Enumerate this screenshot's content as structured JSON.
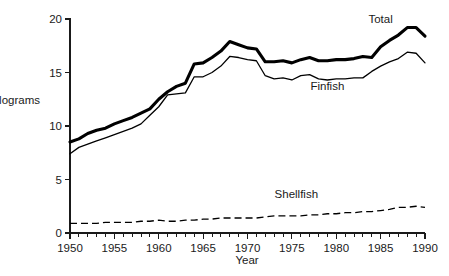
{
  "chart_data": {
    "type": "line",
    "title": "",
    "xlabel": "Year",
    "ylabel": "Kilograms",
    "xlim": [
      1950,
      1990
    ],
    "ylim": [
      0,
      20
    ],
    "grid": false,
    "legend_position": "inline-annotations",
    "yticks": [
      0,
      5,
      10,
      15,
      20
    ],
    "ytick_labels": [
      "0",
      "5",
      "10",
      "15",
      "20"
    ],
    "xticks": [
      1950,
      1955,
      1960,
      1965,
      1970,
      1975,
      1980,
      1985,
      1990
    ],
    "xtick_labels": [
      "1950",
      "1955",
      "1960",
      "1965",
      "1970",
      "1975",
      "1980",
      "1985",
      "1990"
    ],
    "x_minor_tick_interval": 1,
    "x": [
      1950,
      1951,
      1952,
      1953,
      1954,
      1955,
      1956,
      1957,
      1958,
      1959,
      1960,
      1961,
      1962,
      1963,
      1964,
      1965,
      1966,
      1967,
      1968,
      1969,
      1970,
      1971,
      1972,
      1973,
      1974,
      1975,
      1976,
      1977,
      1978,
      1979,
      1980,
      1981,
      1982,
      1983,
      1984,
      1985,
      1986,
      1987,
      1988,
      1989,
      1990
    ],
    "series": [
      {
        "name": "Total",
        "style": "thick-solid",
        "color": "#000000",
        "values": [
          8.5,
          8.8,
          9.3,
          9.6,
          9.8,
          10.2,
          10.5,
          10.8,
          11.2,
          11.6,
          12.5,
          13.2,
          13.7,
          14.0,
          15.8,
          15.9,
          16.4,
          17.0,
          17.9,
          17.6,
          17.3,
          17.2,
          16.0,
          16.0,
          16.1,
          15.9,
          16.2,
          16.4,
          16.1,
          16.1,
          16.2,
          16.2,
          16.3,
          16.5,
          16.4,
          17.4,
          18.0,
          18.5,
          19.2,
          19.2,
          18.4
        ]
      },
      {
        "name": "Finfish",
        "style": "thin-solid",
        "color": "#000000",
        "values": [
          7.4,
          8.0,
          8.3,
          8.6,
          8.9,
          9.2,
          9.5,
          9.8,
          10.2,
          11.0,
          11.8,
          12.9,
          13.0,
          13.1,
          14.6,
          14.6,
          15.0,
          15.6,
          16.5,
          16.4,
          16.2,
          16.1,
          14.7,
          14.4,
          14.5,
          14.3,
          14.7,
          14.8,
          14.4,
          14.3,
          14.4,
          14.4,
          14.5,
          14.5,
          15.1,
          15.6,
          16.0,
          16.3,
          16.9,
          16.8,
          15.9
        ]
      },
      {
        "name": "Shellfish",
        "style": "dashed",
        "color": "#000000",
        "values": [
          0.9,
          0.9,
          0.9,
          0.9,
          1.0,
          1.0,
          1.0,
          1.0,
          1.1,
          1.1,
          1.2,
          1.1,
          1.1,
          1.2,
          1.2,
          1.3,
          1.3,
          1.4,
          1.4,
          1.4,
          1.4,
          1.4,
          1.5,
          1.6,
          1.6,
          1.6,
          1.6,
          1.7,
          1.7,
          1.8,
          1.8,
          1.9,
          1.9,
          2.0,
          2.0,
          2.1,
          2.2,
          2.4,
          2.4,
          2.5,
          2.4
        ]
      }
    ],
    "annotations": [
      {
        "text": "Total",
        "x": 1985.0,
        "y": 19.6
      },
      {
        "text": "Finfish",
        "x": 1979.0,
        "y": 13.4
      },
      {
        "text": "Shellfish",
        "x": 1975.5,
        "y": 3.3
      }
    ]
  }
}
